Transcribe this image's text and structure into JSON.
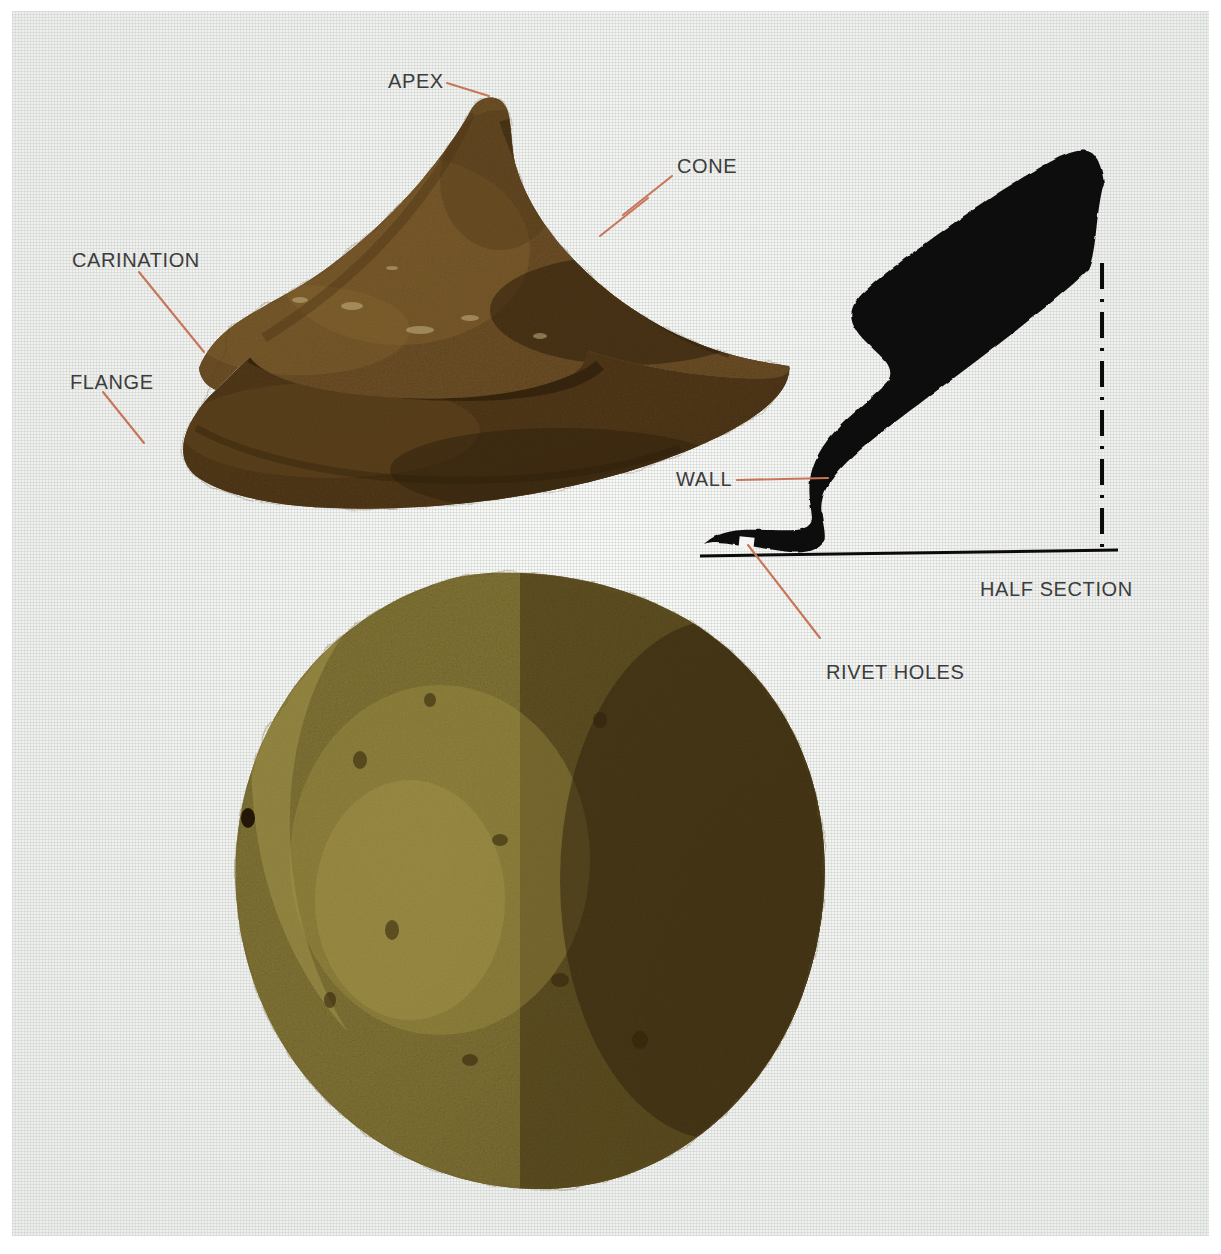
{
  "plate": {
    "title": "Annotated shield boss plate",
    "background_color": "#f2f3f1",
    "paper_margin_color": "#ffffff"
  },
  "style": {
    "leader_color": "#c9755a",
    "label_color": "#3c3c3c",
    "section_ink_color": "#0b0b0b",
    "baseline_color": "#0b0b0b",
    "centerline_color": "#0b0b0b"
  },
  "annotations": [
    {
      "id": "apex",
      "label": "APEX",
      "x": 388,
      "y": 70,
      "target": "cone tip of the boss",
      "leader": "short diagonal to apex"
    },
    {
      "id": "cone",
      "label": "CONE",
      "x": 677,
      "y": 155,
      "target": "sloping cone wall",
      "leader": "diagonal down-left to cone face"
    },
    {
      "id": "carination",
      "label": "CARINATION",
      "x": 72,
      "y": 249,
      "target": "angular ridge where cone meets flange",
      "leader": "diagonal down-right to carination"
    },
    {
      "id": "flange",
      "label": "FLANGE",
      "x": 70,
      "y": 371,
      "target": "flat outer brim",
      "leader": "diagonal down-right to flange edge"
    },
    {
      "id": "wall",
      "label": "WALL",
      "x": 676,
      "y": 468,
      "target": "wall thickness in half section",
      "leader": "horizontal to section wall"
    },
    {
      "id": "rivet_holes",
      "label": "RIVET HOLES",
      "x": 826,
      "y": 661,
      "target": "white gap in the flange of the section",
      "leader": "long diagonal up-left to rivet gap"
    },
    {
      "id": "half_section",
      "label": "HALF SECTION",
      "x": 980,
      "y": 578,
      "target": "caption for the sectional profile drawing",
      "leader": "none"
    }
  ],
  "figures": {
    "side_view": {
      "name": "side-elevation-photograph",
      "description": "Corroded iron conical shield boss seen in profile: pointed apex, sloping cone, carination, flange",
      "colors": {
        "cone_light": "#7c5c2e",
        "cone_mid": "#5e4220",
        "cone_dark": "#3c2812",
        "flange": "#4a3218"
      }
    },
    "plan_view": {
      "name": "plan-view-photograph",
      "description": "Circular top view of the same boss, olive-gold corrosion on the left, dark brown shadow on the right, rivet holes at the left edge",
      "colors": {
        "gold": "#9a8a42",
        "olive": "#867a38",
        "dark": "#4a3519",
        "shadow": "#3a2812"
      }
    },
    "half_section": {
      "name": "half-section-profile-drawing",
      "description": "Solid black S-curved sectional profile with a white rivet-hole gap, a horizontal ground baseline and a vertical dash-dot axis of rotation",
      "baseline": {
        "x1": 700,
        "y1": 556,
        "x2": 1118,
        "y2": 551
      },
      "centerline": {
        "x": 1102,
        "y1": 265,
        "y2": 552,
        "pattern": "dash-dot"
      }
    }
  }
}
